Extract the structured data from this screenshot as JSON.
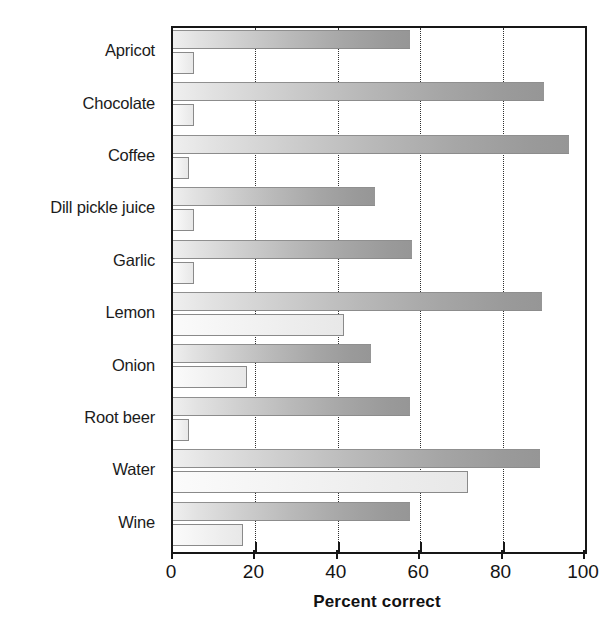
{
  "chart_data": {
    "type": "bar",
    "orientation": "horizontal",
    "title": "",
    "xlabel": "Percent correct",
    "ylabel": "",
    "xlim": [
      0,
      100
    ],
    "xticks": [
      0,
      20,
      40,
      60,
      80,
      100
    ],
    "xtick_labels": [
      "0",
      "20",
      "40",
      "60",
      "80",
      "100"
    ],
    "grid": "vertical-dotted",
    "legend": "none",
    "categories": [
      "Apricot",
      "Chocolate",
      "Coffee",
      "Dill pickle juice",
      "Garlic",
      "Lemon",
      "Onion",
      "Root beer",
      "Water",
      "Wine"
    ],
    "series": [
      {
        "name": "series-1",
        "color": "#9a9a9a",
        "values": [
          57.5,
          90,
          96,
          49,
          58,
          89.5,
          48,
          57.5,
          89,
          57.5
        ]
      },
      {
        "name": "series-2",
        "color": "#ededed",
        "values": [
          5,
          5,
          4,
          5,
          5,
          41.5,
          18,
          4,
          71.5,
          17
        ]
      }
    ]
  },
  "axis": {
    "x_title": "Percent correct"
  },
  "colors": {
    "frame": "#171717",
    "gridline": "#2e2e2e",
    "bar_dark": "#9a9a9a",
    "bar_light": "#ededed",
    "text": "#1b1b1b"
  }
}
